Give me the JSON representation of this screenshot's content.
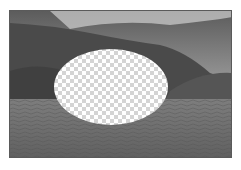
{
  "image": {
    "description": "Grayscale seascape photo with elliptical transparent area",
    "frame": {
      "x": 9,
      "y": 10,
      "width": 223,
      "height": 148
    },
    "cutout": {
      "shape": "ellipse",
      "cx": 101,
      "cy": 76,
      "rx": 57,
      "ry": 38,
      "pattern": "transparency-checkerboard"
    },
    "colors": {
      "sky": "#8a8a8a",
      "cloud": "#cfcfcf",
      "hill": "#4a4a4a",
      "sea": "#6b6b6b",
      "checker_light": "#ffffff",
      "checker_dark": "#d4d4d4"
    }
  }
}
